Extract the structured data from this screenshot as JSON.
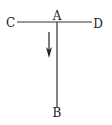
{
  "diagram": {
    "labels": {
      "a": "A",
      "b": "B",
      "c": "C",
      "d": "D"
    },
    "stroke_color": "#333333",
    "background_color": "#ffffff",
    "elements": {
      "horizontal_line": "CD",
      "vertical_line": "AB",
      "arrow_direction": "down"
    }
  }
}
